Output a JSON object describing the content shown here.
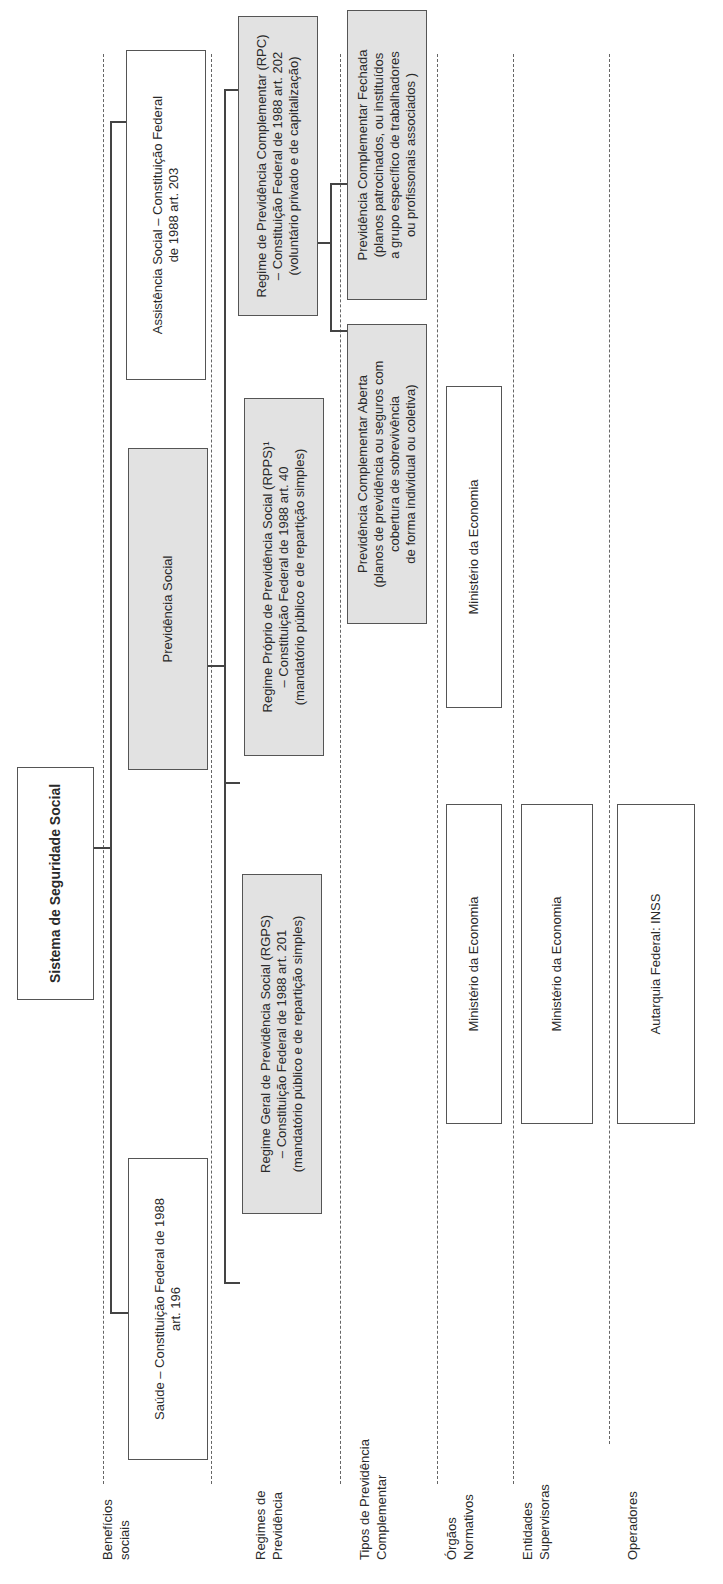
{
  "title": "Sistema de Seguridade Social",
  "row_labels": [
    "Benefícios\nsociais",
    "Regimes de\nPrevidência",
    "Tipos de Previdência\nComplementar",
    "Órgãos\nNormativos",
    "Entidades\nSupervisoras",
    "Operadores"
  ],
  "beneficios": {
    "saude": "Saúde – Constituição Federal de 1988\nart. 196",
    "previdencia": "Previdência Social",
    "assistencia": "Assistência Social – Constituição Federal\nde 1988 art. 203"
  },
  "regimes": {
    "rgps": "Regime Geral de Previdência Social (RGPS)\n– Constituição Federal de 1988 art. 201\n(mandatório público e de repartição simples)",
    "rpps": "Regime Próprio de Previdência Social (RPPS)¹\n– Constituição Federal de 1988 art. 40\n(mandatório público e de repartição simples)",
    "rpc": "Regime de Previdência Complementar (RPC)\n– Constituição Federal de 1988 art. 202\n(voluntário privado e de capitalização)"
  },
  "tipos": {
    "aberta": "Previdência Complementar Aberta\n(planos de previdência ou seguros com\ncobertura de sobrevivência\nde forma individual ou coletiva)",
    "fechada": "Previdência Complementar Fechada\n(planos  patrocinados, ou instituídos\na grupo  específico de trabalhadores\nou profissonais associados )"
  },
  "orgaos_normativos": [
    "Ministério da Economia",
    "Ministério da Economia",
    "Ministério da Economia –\nConselho Nacional de Seguros Privados",
    "Ministério da Economia – Conselho\nNacional de Previdência Complementar"
  ],
  "entidades_supervisoras": [
    "Ministério da Economia",
    "Ministério da Economia",
    "Ministério da Economia – Superintendência\nNacional de Seguros Privados",
    "Ministério da Economia – Superintendência\nNacional de Previdência Complementar\n(PREVIC)²"
  ],
  "operadores": [
    "Autarquia Federal: INSS",
    "Órgãos ou entidades de administração\npública\nInstitutos de Previdência",
    "Sociedades Anônimas\nEntidades Abertas  de Previdência\nComplementar ou Sociedades Seguradoras",
    "Fundação privada ou sociedade civil\nEntidades Fechadas de Previdência\nComplementar (sem fins lucrativos)"
  ],
  "colors": {
    "gray_fill": "#e2e2e2",
    "border": "#555555"
  }
}
